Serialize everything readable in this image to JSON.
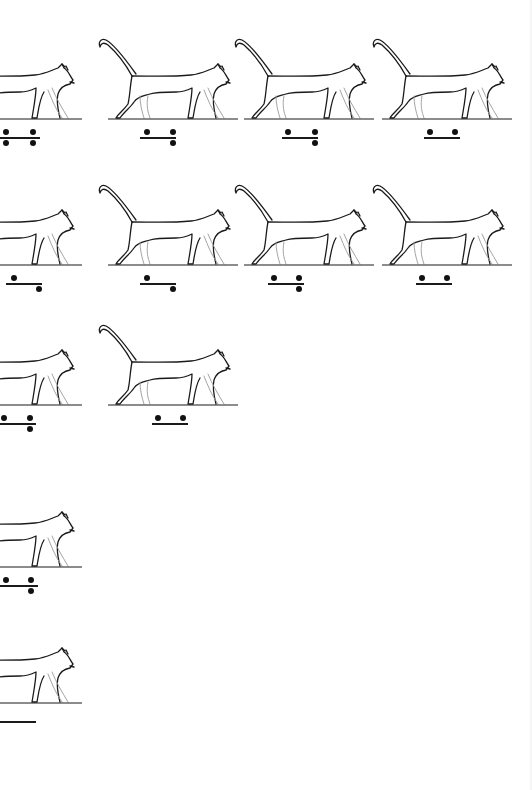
{
  "page": {
    "background": "#ffffff",
    "ink_color": "#1a1a1a",
    "faint_leg_color": "#9a9a9a"
  },
  "figures": [
    {
      "id": "r1c0",
      "row": 1,
      "col": 0,
      "x": -60,
      "y": 30,
      "tail": false,
      "gait": {
        "bar_x": 0,
        "bar_w": 40,
        "above": [
          3,
          30
        ],
        "below": [
          3,
          30
        ]
      }
    },
    {
      "id": "r1c1",
      "row": 1,
      "col": 1,
      "x": 96,
      "y": 30,
      "tail": true,
      "gait": {
        "bar_x": 140,
        "bar_w": 36,
        "above": [
          4,
          30
        ],
        "below": [
          30
        ]
      }
    },
    {
      "id": "r1c2",
      "row": 1,
      "col": 2,
      "x": 232,
      "y": 30,
      "tail": true,
      "gait": {
        "bar_x": 282,
        "bar_w": 36,
        "above": [
          3,
          30
        ],
        "below": [
          30
        ]
      }
    },
    {
      "id": "r1c3",
      "row": 1,
      "col": 3,
      "x": 370,
      "y": 30,
      "tail": true,
      "gait": {
        "bar_x": 424,
        "bar_w": 36,
        "above": [
          3,
          28
        ],
        "below": []
      }
    },
    {
      "id": "r2c0",
      "row": 2,
      "col": 0,
      "x": -60,
      "y": 176,
      "tail": false,
      "gait": {
        "bar_x": 6,
        "bar_w": 36,
        "above": [
          5
        ],
        "below": [
          30
        ]
      }
    },
    {
      "id": "r2c1",
      "row": 2,
      "col": 1,
      "x": 96,
      "y": 176,
      "tail": true,
      "gait": {
        "bar_x": 140,
        "bar_w": 36,
        "above": [
          4
        ],
        "below": [
          30
        ]
      }
    },
    {
      "id": "r2c2",
      "row": 2,
      "col": 2,
      "x": 232,
      "y": 176,
      "tail": true,
      "gait": {
        "bar_x": 268,
        "bar_w": 36,
        "above": [
          3,
          28
        ],
        "below": [
          28
        ]
      }
    },
    {
      "id": "r2c3",
      "row": 2,
      "col": 3,
      "x": 370,
      "y": 176,
      "tail": true,
      "gait": {
        "bar_x": 416,
        "bar_w": 36,
        "above": [
          3,
          28
        ],
        "below": []
      }
    },
    {
      "id": "r3c0",
      "row": 3,
      "col": 0,
      "x": -60,
      "y": 316,
      "tail": false,
      "gait": {
        "bar_x": 0,
        "bar_w": 36,
        "above": [
          1,
          27
        ],
        "below": [
          27
        ]
      }
    },
    {
      "id": "r3c1",
      "row": 3,
      "col": 1,
      "x": 96,
      "y": 316,
      "tail": true,
      "gait": {
        "bar_x": 152,
        "bar_w": 36,
        "above": [
          3,
          28
        ],
        "below": []
      }
    },
    {
      "id": "r4c0",
      "row": 4,
      "col": 0,
      "x": -60,
      "y": 478,
      "tail": false,
      "gait": {
        "bar_x": 0,
        "bar_w": 38,
        "above": [
          3,
          28
        ],
        "below": [
          28
        ]
      }
    },
    {
      "id": "r5c0",
      "row": 5,
      "col": 0,
      "x": -60,
      "y": 614,
      "tail": false,
      "gait": {
        "bar_x": 0,
        "bar_w": 36,
        "above": [],
        "below": []
      }
    }
  ]
}
